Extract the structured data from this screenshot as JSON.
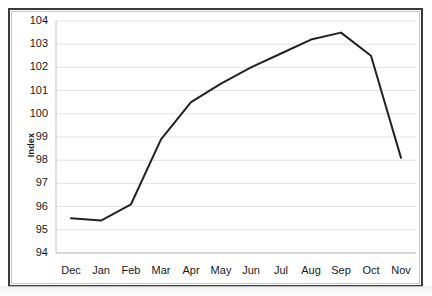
{
  "figure": {
    "y_axis_title": "Index"
  },
  "chart_data": {
    "type": "line",
    "title": "",
    "subtitle": "",
    "xlabel": "",
    "ylabel": "Index",
    "categories": [
      "Dec",
      "Jan",
      "Feb",
      "Mar",
      "Apr",
      "May",
      "Jun",
      "Jul",
      "Aug",
      "Sep",
      "Oct",
      "Nov"
    ],
    "values": [
      95.5,
      95.4,
      96.1,
      98.9,
      100.5,
      101.3,
      102.0,
      102.6,
      103.2,
      103.5,
      102.5,
      98.1
    ],
    "series": [
      {
        "name": "Index",
        "values": [
          95.5,
          95.4,
          96.1,
          98.9,
          100.5,
          101.3,
          102.0,
          102.6,
          103.2,
          103.5,
          102.5,
          98.1
        ]
      }
    ],
    "ylim": [
      94,
      104
    ],
    "yticks": [
      94,
      95,
      96,
      97,
      98,
      99,
      100,
      101,
      102,
      103,
      104
    ],
    "ytick_labels": [
      "94",
      "95",
      "96",
      "97",
      "98",
      "99",
      "100",
      "101",
      "102",
      "103",
      "104"
    ],
    "xtick_labels": [
      "Dec",
      "Jan",
      "Feb",
      "Mar",
      "Apr",
      "May",
      "Jun",
      "Jul",
      "Aug",
      "Sep",
      "Oct",
      "Nov"
    ],
    "grid": true,
    "grid_axis": "y",
    "legend": false,
    "legend_position": "none",
    "line_color": "#222222",
    "line_width": 2,
    "markers": false,
    "plot_background": "#ffffff",
    "grid_color": "#e3e3e3"
  }
}
